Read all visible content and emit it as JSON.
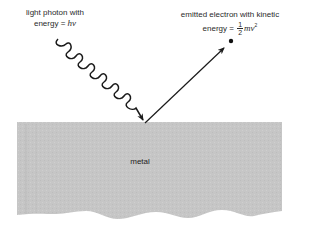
{
  "diagram": {
    "type": "photoelectric-effect",
    "photon": {
      "label_line1": "light photon with",
      "label_line2_prefix": "energy = ",
      "label_line2_symbol": "hν"
    },
    "electron": {
      "label_line1": "emitted electron with kinetic",
      "label_line2_prefix": "energy = ",
      "fraction_numerator": "1",
      "fraction_denominator": "2",
      "label_line2_symbol": "mv",
      "exponent": "2"
    },
    "metal": {
      "label": "metal"
    },
    "colors": {
      "metal_fill": "#c4c4c4",
      "ink": "#1a1a1a",
      "background": "#ffffff"
    }
  }
}
